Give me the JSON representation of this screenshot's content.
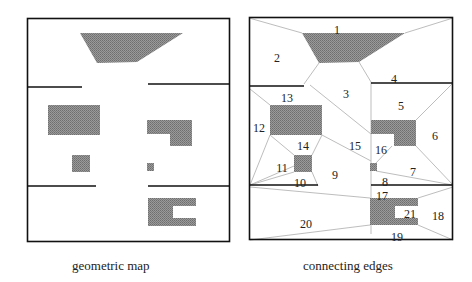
{
  "panels": [
    {
      "id": "geometric",
      "caption": "geometric map"
    },
    {
      "id": "edges",
      "caption": "connecting edges"
    }
  ],
  "region_labels": [
    {
      "id": "1",
      "x": 337,
      "y": 30
    },
    {
      "id": "2",
      "x": 277,
      "y": 58
    },
    {
      "id": "3",
      "x": 346,
      "y": 94
    },
    {
      "id": "4",
      "x": 394,
      "y": 79
    },
    {
      "id": "5",
      "x": 401,
      "y": 106
    },
    {
      "id": "6",
      "x": 435,
      "y": 136
    },
    {
      "id": "7",
      "x": 413,
      "y": 172
    },
    {
      "id": "8",
      "x": 385,
      "y": 182
    },
    {
      "id": "9",
      "x": 335,
      "y": 175
    },
    {
      "id": "10",
      "x": 300,
      "y": 183
    },
    {
      "id": "11",
      "x": 282,
      "y": 168
    },
    {
      "id": "12",
      "x": 259,
      "y": 128
    },
    {
      "id": "13",
      "x": 287,
      "y": 98
    },
    {
      "id": "14",
      "x": 303,
      "y": 146
    },
    {
      "id": "15",
      "x": 355,
      "y": 146
    },
    {
      "id": "16",
      "x": 381,
      "y": 150
    },
    {
      "id": "17",
      "x": 382,
      "y": 196
    },
    {
      "id": "18",
      "x": 438,
      "y": 216
    },
    {
      "id": "19",
      "x": 397,
      "y": 237
    },
    {
      "id": "20",
      "x": 306,
      "y": 224
    },
    {
      "id": "21",
      "x": 410,
      "y": 214
    }
  ],
  "colors": {
    "obstacle": "#8a8a8a",
    "wall": "#111111",
    "edge": "#b5b5b5"
  }
}
